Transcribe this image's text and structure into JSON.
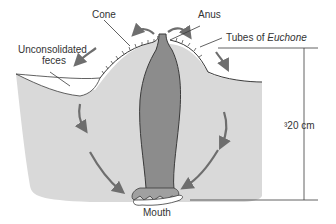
{
  "diagram": {
    "labels": {
      "cone": "Cone",
      "anus": "Anus",
      "unconsolidated_line1": "Unconsolidated",
      "unconsolidated_line2": "feces",
      "tubes_prefix": "Tubes of ",
      "tubes_genus": "Euchone",
      "depth": "³20 cm",
      "mouth": "Mouth"
    },
    "colors": {
      "sediment": "#d9d9d9",
      "worm": "#8c8c8c",
      "arrow": "#6e6e6e",
      "outline": "#3a3a3a",
      "background": "#ffffff"
    }
  }
}
